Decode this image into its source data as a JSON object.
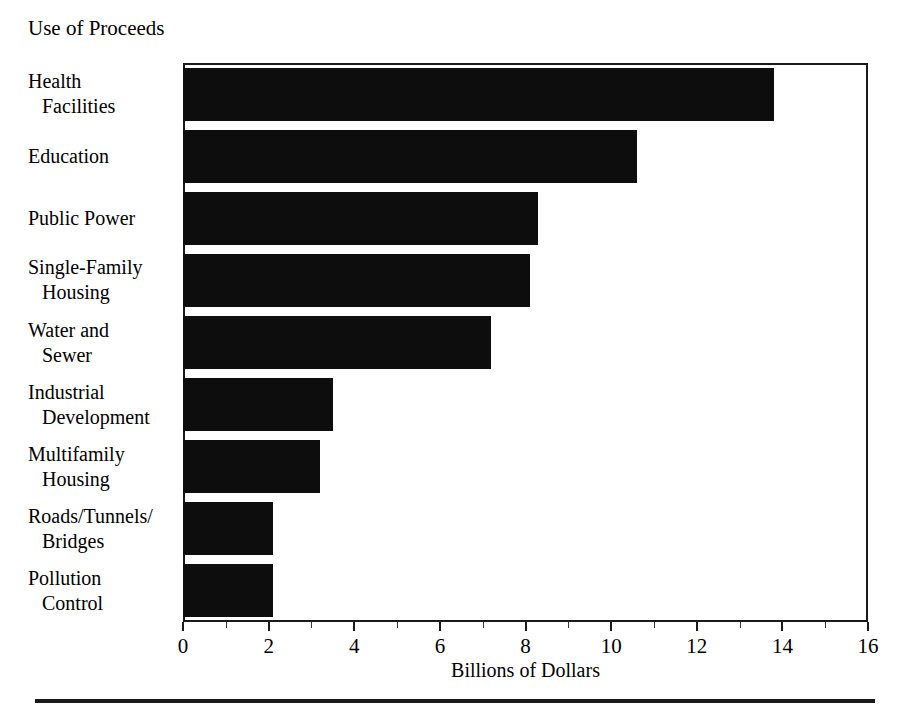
{
  "chart_data": {
    "type": "bar",
    "orientation": "horizontal",
    "title": "Use of Proceeds",
    "xlabel": "Billions of Dollars",
    "ylabel": "",
    "xlim": [
      0,
      16
    ],
    "grid": false,
    "legend": false,
    "bar_color": "#0d0d0d",
    "categories": [
      "Health Facilities",
      "Education",
      "Public Power",
      "Single-Family Housing",
      "Water and Sewer",
      "Industrial Development",
      "Multifamily Housing",
      "Roads/Tunnels/Bridges",
      "Pollution Control"
    ],
    "values": [
      13.8,
      10.6,
      8.3,
      8.1,
      7.2,
      3.5,
      3.2,
      2.1,
      2.1
    ],
    "xticks": [
      0,
      2,
      4,
      6,
      8,
      10,
      12,
      14,
      16
    ],
    "xtick_labels": [
      "0",
      "2",
      "4",
      "6",
      "8",
      "10",
      "12",
      "14",
      "16"
    ],
    "xminor_ticks": [
      1,
      3,
      5,
      7,
      9,
      11,
      13,
      15
    ]
  },
  "labels": [
    {
      "line1": "Health",
      "line2": "Facilities"
    },
    {
      "line1": "Education",
      "line2": ""
    },
    {
      "line1": "Public Power",
      "line2": ""
    },
    {
      "line1": "Single-Family",
      "line2": "Housing"
    },
    {
      "line1": "Water and",
      "line2": "Sewer"
    },
    {
      "line1": "Industrial",
      "line2": "Development"
    },
    {
      "line1": "Multifamily",
      "line2": "Housing"
    },
    {
      "line1": "Roads/Tunnels/",
      "line2": "Bridges"
    },
    {
      "line1": "Pollution",
      "line2": "Control"
    }
  ]
}
